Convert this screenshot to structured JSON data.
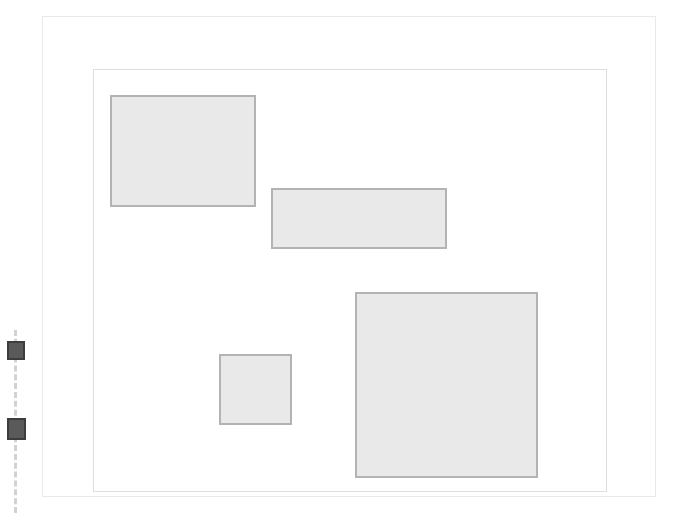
{
  "canvas": {
    "width": 695,
    "height": 513,
    "background_color": "#ffffff"
  },
  "frames": [
    {
      "name": "outer-frame",
      "x": 42,
      "y": 16,
      "width": 614,
      "height": 481,
      "border_color": "#e9e9e9",
      "border_width": 1
    },
    {
      "name": "inner-frame",
      "x": 93,
      "y": 69,
      "width": 514,
      "height": 423,
      "border_color": "#dedede",
      "border_width": 1
    }
  ],
  "regions": [
    {
      "name": "region-top-left",
      "x": 110,
      "y": 95,
      "width": 146,
      "height": 112,
      "fill_color": "#e9e9e9",
      "border_color": "#b3b3b3"
    },
    {
      "name": "region-upper-middle-wide",
      "x": 271,
      "y": 188,
      "width": 176,
      "height": 61,
      "fill_color": "#e9e9e9",
      "border_color": "#b3b3b3"
    },
    {
      "name": "region-lower-left-small",
      "x": 219,
      "y": 354,
      "width": 73,
      "height": 71,
      "fill_color": "#e9e9e9",
      "border_color": "#b3b3b3"
    },
    {
      "name": "region-bottom-right-large",
      "x": 355,
      "y": 292,
      "width": 183,
      "height": 186,
      "fill_color": "#e9e9e9",
      "border_color": "#b3b3b3"
    }
  ],
  "marker_track": {
    "name": "left-marker-track",
    "x": 14,
    "y": 330,
    "height": 183,
    "line_color": "#d2d2d2",
    "line_style": "dashed",
    "line_width": 3,
    "markers": [
      {
        "name": "marker-upper",
        "x": 7,
        "y": 341,
        "width": 18,
        "height": 19,
        "fill_color": "#5a5a5a",
        "border_color": "#3d3d3d"
      },
      {
        "name": "marker-lower",
        "x": 7,
        "y": 418,
        "width": 19,
        "height": 22,
        "fill_color": "#5a5a5a",
        "border_color": "#3d3d3d"
      }
    ]
  }
}
